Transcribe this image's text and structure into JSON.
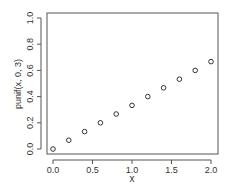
{
  "chart_data": {
    "type": "scatter",
    "title": "",
    "xlabel": "x",
    "ylabel": "punif(x, 0, 3)",
    "xlim": [
      0,
      2
    ],
    "ylim": [
      0,
      1
    ],
    "x_ticks": [
      "0.0",
      "0.5",
      "1.0",
      "1.5",
      "2.0"
    ],
    "y_ticks": [
      "0.0",
      "0.2",
      "0.4",
      "0.6",
      "0.8",
      "1.0"
    ],
    "x": [
      0.0,
      0.2,
      0.4,
      0.6,
      0.8,
      1.0,
      1.2,
      1.4,
      1.6,
      1.8,
      2.0
    ],
    "y": [
      0.0,
      0.067,
      0.133,
      0.2,
      0.267,
      0.333,
      0.4,
      0.467,
      0.533,
      0.6,
      0.667
    ],
    "marker": "open-circle",
    "grid": false,
    "legend": null
  }
}
